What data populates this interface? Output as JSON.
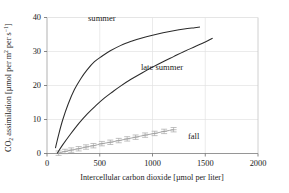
{
  "chart_data": {
    "type": "line",
    "title": "",
    "xlabel": "Intercellular carbon dioxide [µmol per liter]",
    "ylabel": "CO2 assimilation [µmol per m2 per s-1]",
    "xlim": [
      0,
      2000
    ],
    "ylim": [
      0,
      40
    ],
    "xticks": [
      0,
      500,
      1000,
      1500,
      2000
    ],
    "yticks": [
      0,
      10,
      20,
      30,
      40
    ],
    "xtick_labels": [
      "0",
      "500",
      "1000",
      "1500",
      "2000"
    ],
    "ytick_labels": [
      "0",
      "10",
      "20",
      "30",
      "40"
    ],
    "grid": true,
    "legend_position": "inline-annotations",
    "series": [
      {
        "name": "summer",
        "style": "smooth-curve",
        "color": "#2b2b2b",
        "markers": false,
        "x": [
          80,
          110,
          150,
          200,
          260,
          320,
          380,
          450,
          520,
          600,
          700,
          800,
          900,
          1000,
          1100,
          1200,
          1300,
          1400,
          1450
        ],
        "y": [
          1.6,
          5.5,
          10.0,
          14.5,
          18.8,
          22.0,
          24.6,
          27.0,
          28.6,
          30.2,
          31.8,
          33.0,
          34.0,
          34.8,
          35.5,
          36.1,
          36.6,
          37.0,
          37.2
        ]
      },
      {
        "name": "late summer",
        "style": "smooth-curve",
        "color": "#2b2b2b",
        "markers": false,
        "x": [
          95,
          150,
          220,
          300,
          380,
          460,
          540,
          620,
          700,
          800,
          900,
          1000,
          1100,
          1200,
          1300,
          1400,
          1500,
          1570
        ],
        "y": [
          0.0,
          2.6,
          5.6,
          8.8,
          11.6,
          14.0,
          16.2,
          18.1,
          19.9,
          21.9,
          23.7,
          25.4,
          27.0,
          28.5,
          30.0,
          31.4,
          32.8,
          33.9
        ]
      },
      {
        "name": "fall",
        "style": "scatter-with-errorbars-and-fit",
        "color": "#9a9a9a",
        "markers": true,
        "x": [
          110,
          170,
          230,
          300,
          370,
          440,
          520,
          600,
          680,
          760,
          840,
          930,
          1020,
          1110,
          1200
        ],
        "y": [
          0.1,
          0.6,
          1.0,
          1.4,
          1.9,
          2.3,
          2.9,
          3.3,
          3.8,
          4.3,
          4.8,
          5.4,
          5.9,
          6.5,
          7.0
        ]
      }
    ],
    "annotations": [
      {
        "label": "summer",
        "x": 520,
        "y": 39.0
      },
      {
        "label": "late summer",
        "x": 1090,
        "y": 24.6
      },
      {
        "label": "fall",
        "x": 1390,
        "y": 4.2
      }
    ]
  },
  "axis": {
    "y_title_parts": {
      "co": "CO",
      "co_sub": "2",
      "mid": " assimilation [µmol per m",
      "m_sup": "2",
      "mid2": " per s",
      "s_sup": "−1",
      "tail": "]"
    },
    "x_title": "Intercellular carbon dioxide [µmol per liter]"
  },
  "colors": {
    "curve": "#2b2b2b",
    "fall": "#9a9a9a",
    "frame": "#b8b8b8",
    "grid": "#dcdcdc",
    "text": "#1c1c1c"
  }
}
